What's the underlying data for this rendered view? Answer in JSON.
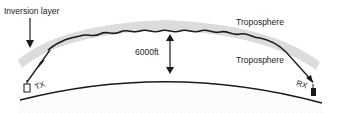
{
  "diagram": {
    "labels": {
      "inversion_layer": "Inversion layer",
      "troposphere_upper": "Troposphere",
      "troposphere_lower": "Troposphere",
      "height": "6000ft",
      "transmitter": "TX",
      "receiver": "RX"
    },
    "colors": {
      "line": "#1a1a1a",
      "inversion_band": "#cfcfcf",
      "ground_stipple": "#bdbdbd",
      "background": "#ffffff"
    }
  }
}
